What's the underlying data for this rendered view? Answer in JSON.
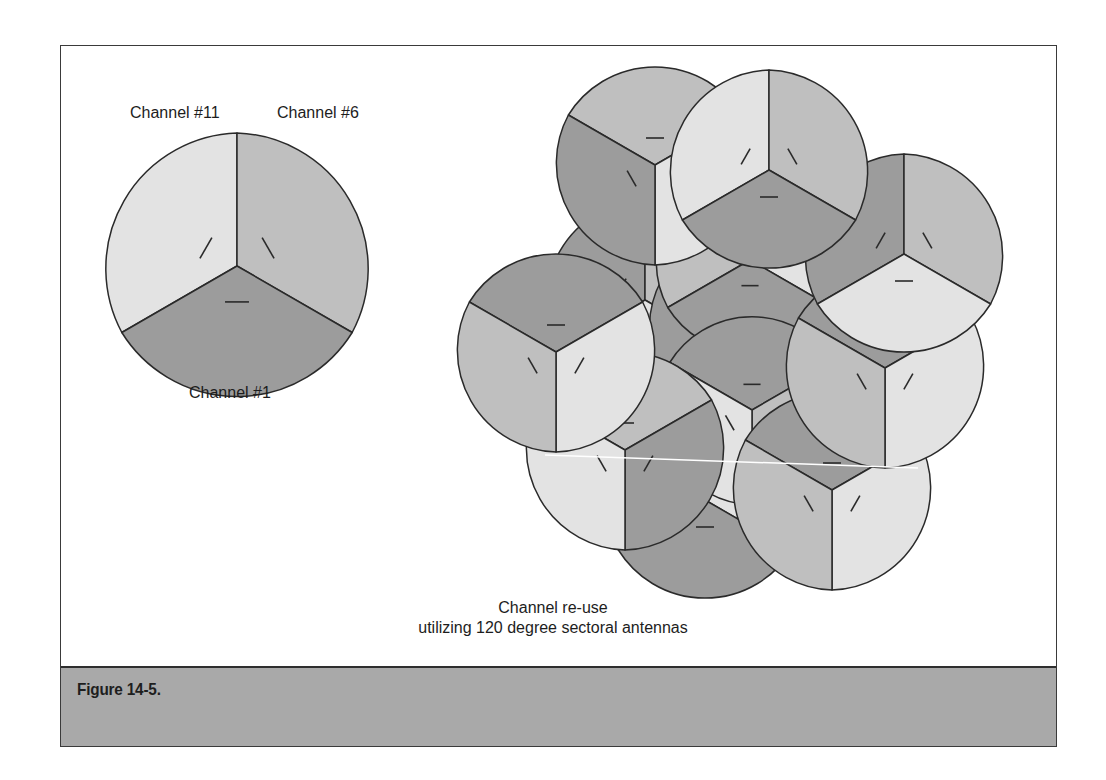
{
  "figure": {
    "label": "Figure 14-5.",
    "caption_line1": "Channel re-use",
    "caption_line2": "utilizing 120 degree sectoral antennas"
  },
  "single_cell": {
    "labels": {
      "top_left": "Channel #11",
      "top_right": "Channel #6",
      "bottom": "Channel #1"
    }
  },
  "colors": {
    "light": "#e3e3e3",
    "mid": "#bfbfbf",
    "dark": "#9c9c9c",
    "outline": "#2a2a2a",
    "band": "#a9a9a9"
  },
  "cells": [
    {
      "id": "single",
      "cx": 237,
      "cy": 266,
      "r": 133,
      "rot": 0,
      "fills": [
        "light",
        "mid",
        "dark"
      ]
    },
    {
      "id": "c-mid-left",
      "cx": 645,
      "cy": 300,
      "r": 100,
      "rot": 0,
      "fills": [
        "dark",
        "mid",
        "light"
      ]
    },
    {
      "id": "c-mid-center",
      "cx": 748,
      "cy": 330,
      "r": 100,
      "rot": 60,
      "fills": [
        "mid",
        "light",
        "dark"
      ]
    },
    {
      "id": "c-mid-top",
      "cx": 750,
      "cy": 260,
      "r": 95,
      "rot": 0,
      "fills": [
        "mid",
        "light",
        "dark"
      ]
    },
    {
      "id": "c-bottom-mid",
      "cx": 705,
      "cy": 500,
      "r": 100,
      "rot": 0,
      "fills": [
        "mid",
        "light",
        "dark"
      ]
    },
    {
      "id": "c-center",
      "cx": 752,
      "cy": 410,
      "r": 95,
      "rot": 60,
      "fills": [
        "dark",
        "mid",
        "light"
      ]
    },
    {
      "id": "c-lower-left",
      "cx": 625,
      "cy": 450,
      "r": 100,
      "rot": 60,
      "fills": [
        "mid",
        "dark",
        "light"
      ]
    },
    {
      "id": "c-lower-right",
      "cx": 832,
      "cy": 490,
      "r": 100,
      "rot": 60,
      "fills": [
        "dark",
        "light",
        "mid"
      ]
    },
    {
      "id": "c-right-mid",
      "cx": 885,
      "cy": 368,
      "r": 100,
      "rot": 60,
      "fills": [
        "dark",
        "light",
        "mid"
      ]
    },
    {
      "id": "c-left",
      "cx": 556,
      "cy": 352,
      "r": 100,
      "rot": 60,
      "fills": [
        "dark",
        "light",
        "mid"
      ]
    },
    {
      "id": "c-right-top",
      "cx": 904,
      "cy": 254,
      "r": 100,
      "rot": 0,
      "fills": [
        "dark",
        "mid",
        "light"
      ]
    },
    {
      "id": "c-top-left",
      "cx": 655,
      "cy": 165,
      "r": 100,
      "rot": 60,
      "fills": [
        "mid",
        "light",
        "dark"
      ]
    },
    {
      "id": "c-top-right",
      "cx": 769,
      "cy": 170,
      "r": 100,
      "rot": 0,
      "fills": [
        "light",
        "mid",
        "dark"
      ]
    }
  ]
}
